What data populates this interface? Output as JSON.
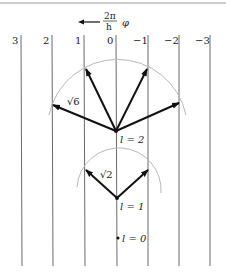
{
  "diagram": {
    "axis_label": {
      "fraction_num": "2π",
      "fraction_den": "h",
      "symbol": "φ"
    },
    "columns": [
      {
        "label": "3",
        "x": 21
      },
      {
        "label": "2",
        "x": 52
      },
      {
        "label": "1",
        "x": 84
      },
      {
        "label": "0",
        "x": 116
      },
      {
        "label": "−1",
        "x": 148
      },
      {
        "label": "−2",
        "x": 179
      },
      {
        "label": "−3",
        "x": 210
      }
    ],
    "states": [
      {
        "label": "l = 2",
        "magnitude_label": "√6"
      },
      {
        "label": "l = 1",
        "magnitude_label": "√2"
      },
      {
        "label": "l = 0"
      }
    ],
    "colors": {
      "lines": "#333333",
      "arc": "#b0b0b0",
      "arrows": "#111111"
    }
  }
}
